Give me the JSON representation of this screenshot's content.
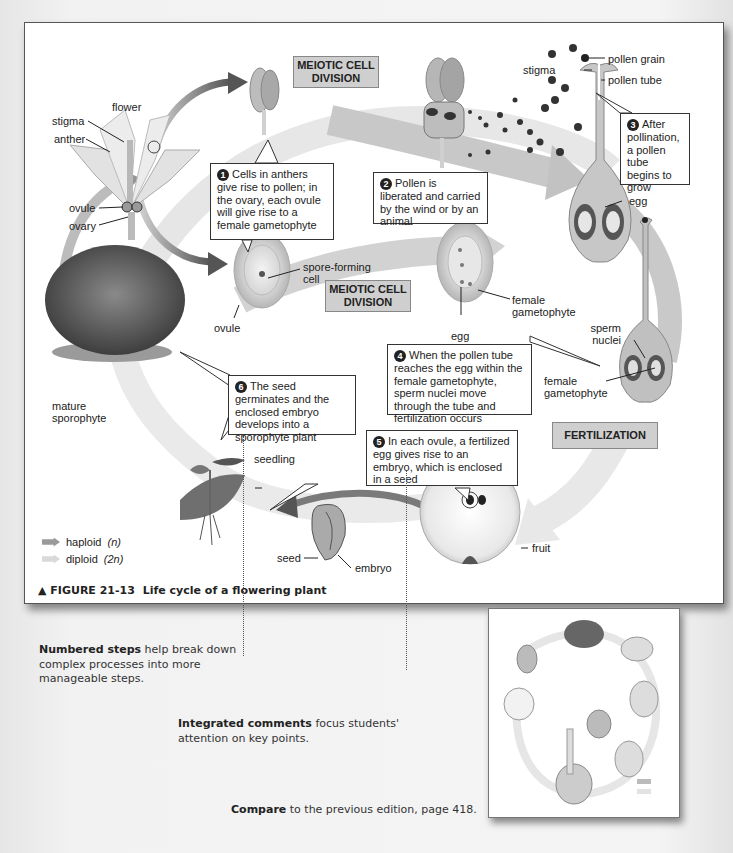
{
  "figure": {
    "caption_marker": "▲",
    "caption_number": "FIGURE 21-13",
    "caption_title": "Life cycle of a flowering plant",
    "colors": {
      "haploid": "#9a9a9a",
      "diploid": "#d9d9d9",
      "stage_box": "#cfcfcf",
      "arrow_dark": "#6f6f6f"
    },
    "labels": {
      "flower": "flower",
      "stigma_left": "stigma",
      "anther": "anther",
      "ovule_left": "ovule",
      "ovary": "ovary",
      "spore_forming_cell": "spore-forming cell",
      "ovule_mid": "ovule",
      "female_gametophyte_mid": "female gametophyte",
      "egg_mid": "egg",
      "stigma_right": "stigma",
      "pollen_grain": "pollen grain",
      "pollen_tube": "pollen tube",
      "egg_right": "egg",
      "sperm_nuclei": "sperm nuclei",
      "female_gametophyte_right": "female gametophyte",
      "mature_sporophyte": "mature sporophyte",
      "seedling": "seedling",
      "seed": "seed",
      "embryo": "embryo",
      "fruit": "fruit"
    },
    "stages": {
      "meiotic_top": "MEIOTIC CELL DIVISION",
      "meiotic_mid": "MEIOTIC CELL DIVISION",
      "fertilization": "FERTILIZATION"
    },
    "steps": [
      {
        "n": "1",
        "text": "Cells in anthers give rise to pollen; in the ovary, each ovule will give rise to a female gametophyte"
      },
      {
        "n": "2",
        "text": "Pollen is liberated and carried by the wind or by an animal"
      },
      {
        "n": "3",
        "text": "After pollination, a pollen tube begins to grow"
      },
      {
        "n": "4",
        "text": "When the pollen tube reaches the egg within the female gametophyte, sperm nuclei move through the tube and fertilization occurs"
      },
      {
        "n": "5",
        "text": "In each ovule, a fertilized egg gives rise to an embryo, which is enclosed in a seed"
      },
      {
        "n": "6",
        "text": "The seed germinates and the enclosed embryo develops into a sporophyte plant"
      }
    ],
    "legend": [
      {
        "label": "haploid",
        "symbol": "(n)"
      },
      {
        "label": "diploid",
        "symbol": "(2n)"
      }
    ]
  },
  "notes": {
    "numbered_bold": "Numbered steps",
    "numbered_rest": " help break down complex processes into more manageable steps.",
    "integrated_bold": "Integrated comments",
    "integrated_rest": " focus students' attention on key points.",
    "compare_bold": "Compare",
    "compare_rest": " to the previous edition, page 418."
  }
}
